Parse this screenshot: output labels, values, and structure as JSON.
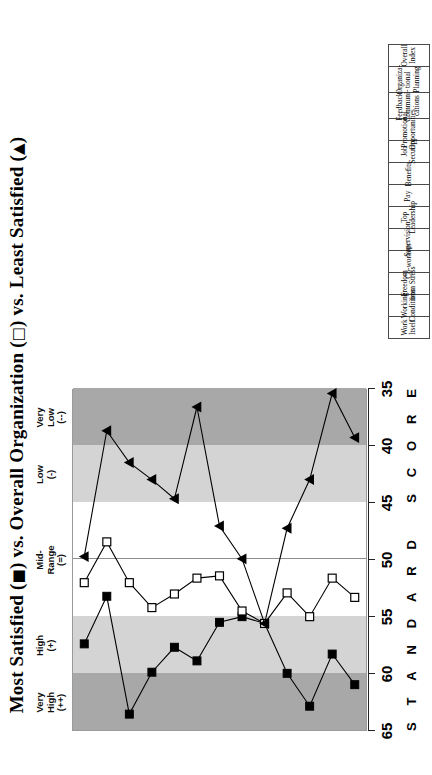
{
  "title": {
    "prefix": "Most Satisfied (",
    "glyph1": "■",
    "mid1": ") vs. Overall Organization (",
    "glyph2": "□",
    "mid2": ") vs. Least Satisfied (",
    "glyph3": "▲",
    "suffix": ")",
    "full": "Most Satisfied (■) vs. Overall Organization (□) vs. Least Satisfied (▲)"
  },
  "axis": {
    "name": "STANDARD SCORE",
    "letters": [
      "S",
      "T",
      "A",
      "N",
      "D",
      "A",
      "R",
      "D",
      "",
      "S",
      "C",
      "O",
      "R",
      "E"
    ],
    "ticks": [
      65,
      60,
      55,
      50,
      45,
      40,
      35
    ],
    "min": 35,
    "max": 65,
    "midline_value": 50
  },
  "bands": [
    {
      "label": "Very\nHigh\n(++)",
      "from": 60,
      "to": 65,
      "color": "#a8a8a8"
    },
    {
      "label": "High\n(+)",
      "from": 55,
      "to": 60,
      "color": "#d4d4d4"
    },
    {
      "label": "Mid-\nRange\n(=)",
      "from": 45,
      "to": 55,
      "color": "#ffffff"
    },
    {
      "label": "Low\n(-)",
      "from": 40,
      "to": 45,
      "color": "#d4d4d4"
    },
    {
      "label": "Very\nLow\n(--)",
      "from": 35,
      "to": 40,
      "color": "#a8a8a8"
    }
  ],
  "legend": {
    "most_satisfied": "Most Satisfied",
    "overall_organization": "Overall Organization",
    "least_satisfied": "Least Satisfied",
    "marker_most": "■",
    "marker_overall": "□",
    "marker_least": "▲"
  },
  "chart_data": {
    "type": "line",
    "title": "Most Satisfied (■) vs. Overall Organization (□) vs. Least Satisfied (▲)",
    "xlabel": "",
    "ylabel": "STANDARD SCORE",
    "ylim": [
      35,
      65
    ],
    "yticks": [
      35,
      40,
      45,
      50,
      55,
      60,
      65
    ],
    "grid": false,
    "legend_position": "in-title",
    "orientation": "horizontal-categories-vertical-score",
    "categories": [
      "Work\nItself",
      "Working\nConditions",
      "Freedom\nfrom Stress",
      "Co-workers",
      "Supervision",
      "Top\nLeadership",
      "Pay",
      "Benefits",
      "Job\nSecurity",
      "Promotional\nOpportunities",
      "Feedback/\nCommuni-\ncations",
      "Organiza-\ntional\nPlanning",
      "Overall\nIndex"
    ],
    "series": [
      {
        "name": "Most Satisfied",
        "marker": "filled-square",
        "color": "#000000",
        "values": [
          57.4,
          53.2,
          63.6,
          59.9,
          57.7,
          58.9,
          55.5,
          55.0,
          55.6,
          60.0,
          62.9,
          58.3,
          61.0
        ]
      },
      {
        "name": "Overall Organization",
        "marker": "open-square",
        "color": "#000000",
        "values": [
          52.0,
          48.4,
          52.0,
          54.2,
          53.0,
          51.6,
          51.4,
          54.5,
          55.6,
          52.9,
          55.0,
          51.6,
          53.3
        ]
      },
      {
        "name": "Least Satisfied",
        "marker": "filled-triangle",
        "color": "#000000",
        "values": [
          49.7,
          38.6,
          41.4,
          42.9,
          44.6,
          36.5,
          47.0,
          49.9,
          55.6,
          47.2,
          42.9,
          35.3,
          39.2
        ]
      }
    ]
  }
}
